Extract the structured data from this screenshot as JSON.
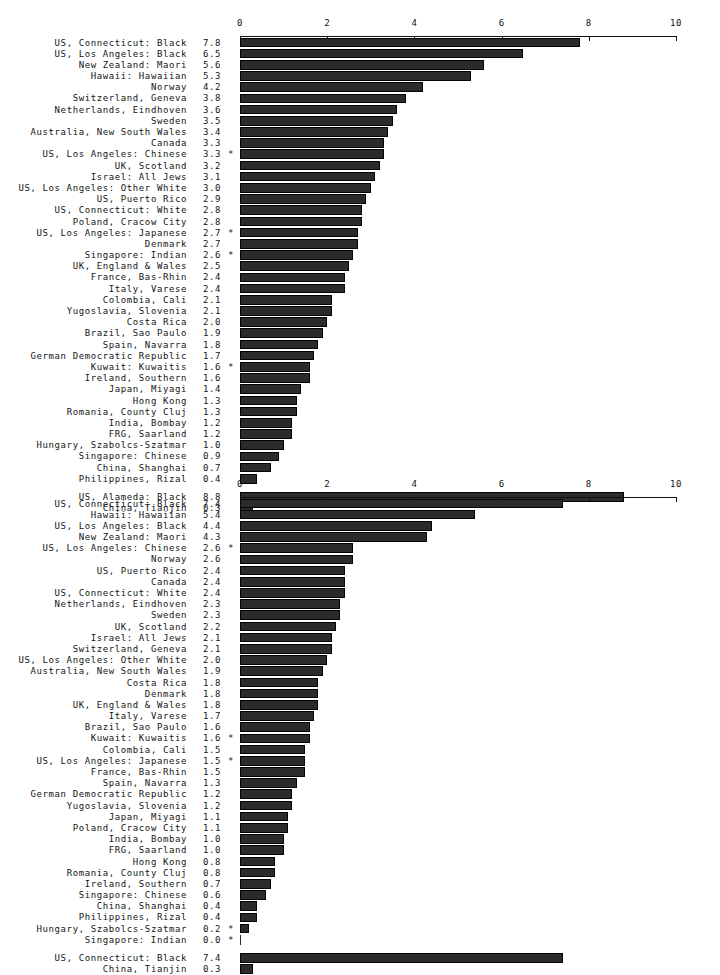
{
  "page": {
    "background": "#ffffff",
    "bar_color": "#2b2b2b",
    "text_color": "#141414"
  },
  "chart_data": [
    {
      "id": "chart-1",
      "type": "bar",
      "orientation": "horizontal",
      "title": "",
      "xlabel": "",
      "ylabel": "",
      "xlim": [
        0,
        10
      ],
      "grid": false,
      "legend": null,
      "ticks": [
        0,
        2,
        4,
        6,
        8,
        10
      ],
      "tick_labels": [
        "0",
        "2",
        "4",
        "6",
        "8",
        "10"
      ],
      "categories": [
        "US, Connecticut: Black",
        "US, Los Angeles: Black",
        "New Zealand: Maori",
        "Hawaii: Hawaiian",
        "Norway",
        "Switzerland, Geneva",
        "Netherlands, Eindhoven",
        "Sweden",
        "Australia, New South Wales",
        "Canada",
        "US, Los Angeles: Chinese",
        "UK, Scotland",
        "Israel: All Jews",
        "US, Los Angeles: Other White",
        "US, Puerto Rico",
        "US, Connecticut: White",
        "Poland, Cracow City",
        "US, Los Angeles: Japanese",
        "Denmark",
        "Singapore: Indian",
        "UK, England & Wales",
        "France, Bas-Rhin",
        "Italy, Varese",
        "Colombia, Cali",
        "Yugoslavia, Slovenia",
        "Costa Rica",
        "Brazil, Sao Paulo",
        "Spain, Navarra",
        "German Democratic Republic",
        "Kuwait: Kuwaitis",
        "Ireland, Southern",
        "Japan, Miyagi",
        "Hong Kong",
        "Romania, County Cluj",
        "India, Bombay",
        "FRG, Saarland",
        "Hungary, Szabolcs-Szatmar",
        "Singapore: Chinese",
        "China, Shanghai",
        "Philippines, Rizal"
      ],
      "values": [
        7.8,
        6.5,
        5.6,
        5.3,
        4.2,
        3.8,
        3.6,
        3.5,
        3.4,
        3.3,
        3.3,
        3.2,
        3.1,
        3.0,
        2.9,
        2.8,
        2.8,
        2.7,
        2.7,
        2.6,
        2.5,
        2.4,
        2.4,
        2.1,
        2.1,
        2.0,
        1.9,
        1.8,
        1.7,
        1.6,
        1.6,
        1.4,
        1.3,
        1.3,
        1.2,
        1.2,
        1.0,
        0.9,
        0.7,
        0.4
      ],
      "value_labels": [
        "7.8",
        "6.5",
        "5.6",
        "5.3",
        "4.2",
        "3.8",
        "3.6",
        "3.5",
        "3.4",
        "3.3",
        "3.3",
        "3.2",
        "3.1",
        "3.0",
        "2.9",
        "2.8",
        "2.8",
        "2.7",
        "2.7",
        "2.6",
        "2.5",
        "2.4",
        "2.4",
        "2.1",
        "2.1",
        "2.0",
        "1.9",
        "1.8",
        "1.7",
        "1.6",
        "1.6",
        "1.4",
        "1.3",
        "1.3",
        "1.2",
        "1.2",
        "1.0",
        "0.9",
        "0.7",
        "0.4"
      ],
      "annotations": [
        "",
        "",
        "",
        "",
        "",
        "",
        "",
        "",
        "",
        "",
        "*",
        "",
        "",
        "",
        "",
        "",
        "",
        "*",
        "",
        "*",
        "",
        "",
        "",
        "",
        "",
        "",
        "",
        "",
        "",
        "*",
        "",
        "",
        "",
        "",
        "",
        "",
        "",
        "",
        "",
        ""
      ],
      "extra_group": {
        "categories": [
          "US, Alameda: Black",
          "China, Tianjin"
        ],
        "values": [
          8.8,
          0.3
        ],
        "value_labels": [
          "8.8",
          "0.3"
        ],
        "annotations": [
          "",
          ""
        ]
      }
    },
    {
      "id": "chart-2",
      "type": "bar",
      "orientation": "horizontal",
      "title": "",
      "xlabel": "",
      "ylabel": "",
      "xlim": [
        0,
        10
      ],
      "grid": false,
      "legend": null,
      "ticks": [
        0,
        2,
        4,
        6,
        8,
        10
      ],
      "tick_labels": [
        "0",
        "2",
        "4",
        "6",
        "8",
        "10"
      ],
      "categories": [
        "US, Connecticut: Black",
        "Hawaii: Hawaiian",
        "US, Los Angeles: Black",
        "New Zealand: Maori",
        "US, Los Angeles: Chinese",
        "Norway",
        "US, Puerto Rico",
        "Canada",
        "US, Connecticut: White",
        "Netherlands, Eindhoven",
        "Sweden",
        "UK, Scotland",
        "Israel: All Jews",
        "Switzerland, Geneva",
        "US, Los Angeles: Other White",
        "Australia, New South Wales",
        "Costa Rica",
        "Denmark",
        "UK, England & Wales",
        "Italy, Varese",
        "Brazil, Sao Paulo",
        "Kuwait: Kuwaitis",
        "Colombia, Cali",
        "US, Los Angeles: Japanese",
        "France, Bas-Rhin",
        "Spain, Navarra",
        "German Democratic Republic",
        "Yugoslavia, Slovenia",
        "Japan, Miyagi",
        "Poland, Cracow City",
        "India, Bombay",
        "FRG, Saarland",
        "Hong Kong",
        "Romania, County Cluj",
        "Ireland, Southern",
        "Singapore: Chinese",
        "China, Shanghai",
        "Philippines, Rizal",
        "Hungary, Szabolcs-Szatmar",
        "Singapore: Indian"
      ],
      "values": [
        7.4,
        5.4,
        4.4,
        4.3,
        2.6,
        2.6,
        2.4,
        2.4,
        2.4,
        2.3,
        2.3,
        2.2,
        2.1,
        2.1,
        2.0,
        1.9,
        1.8,
        1.8,
        1.8,
        1.7,
        1.6,
        1.6,
        1.5,
        1.5,
        1.5,
        1.3,
        1.2,
        1.2,
        1.1,
        1.1,
        1.0,
        1.0,
        0.8,
        0.8,
        0.7,
        0.6,
        0.4,
        0.4,
        0.2,
        0.0
      ],
      "value_labels": [
        "7.4",
        "5.4",
        "4.4",
        "4.3",
        "2.6",
        "2.6",
        "2.4",
        "2.4",
        "2.4",
        "2.3",
        "2.3",
        "2.2",
        "2.1",
        "2.1",
        "2.0",
        "1.9",
        "1.8",
        "1.8",
        "1.8",
        "1.7",
        "1.6",
        "1.6",
        "1.5",
        "1.5",
        "1.5",
        "1.3",
        "1.2",
        "1.2",
        "1.1",
        "1.1",
        "1.0",
        "1.0",
        "0.8",
        "0.8",
        "0.7",
        "0.6",
        "0.4",
        "0.4",
        "0.2",
        "0.0"
      ],
      "annotations": [
        "",
        "",
        "",
        "",
        "*",
        "",
        "",
        "",
        "",
        "",
        "",
        "",
        "",
        "",
        "",
        "",
        "",
        "",
        "",
        "",
        "",
        "*",
        "",
        "*",
        "",
        "",
        "",
        "",
        "",
        "",
        "",
        "",
        "",
        "",
        "",
        "",
        "",
        "",
        "*",
        "*"
      ],
      "extra_group": {
        "categories": [
          "US, Connecticut: Black",
          "China, Tianjin"
        ],
        "values": [
          7.4,
          0.3
        ],
        "value_labels": [
          "7.4",
          "0.3"
        ],
        "annotations": [
          "",
          ""
        ]
      }
    }
  ]
}
